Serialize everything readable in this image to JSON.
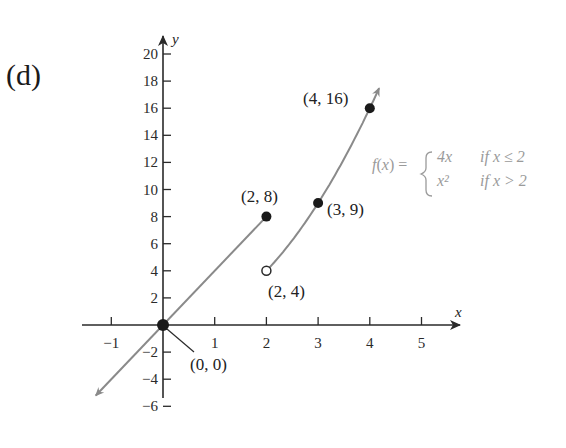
{
  "panel_label": "(d)",
  "chart_data": {
    "type": "line",
    "title": "",
    "xlabel": "x",
    "ylabel": "y",
    "xlim": [
      -1.5,
      5.7
    ],
    "ylim": [
      -7,
      21
    ],
    "grid": false,
    "x_ticks": [
      -1,
      1,
      2,
      3,
      4,
      5
    ],
    "x_tick_labels": [
      "-1",
      "1",
      "2",
      "3",
      "4",
      "5"
    ],
    "y_ticks": [
      -6,
      -4,
      -2,
      2,
      4,
      6,
      8,
      10,
      12,
      14,
      16,
      18,
      20
    ],
    "y_tick_labels": [
      "-6",
      "-4",
      "-2",
      "2",
      "4",
      "6",
      "8",
      "10",
      "12",
      "14",
      "16",
      "18",
      "20"
    ],
    "function_label": "f(x) =",
    "piecewise": [
      {
        "expr": "4x",
        "condition": "if x ≤ 2"
      },
      {
        "expr": "x²",
        "condition": "if x > 2"
      }
    ],
    "series": [
      {
        "name": "4x (x ≤ 2)",
        "x": [
          -1.3,
          0,
          2
        ],
        "y": [
          -5.2,
          0,
          8
        ],
        "arrow_start": true
      },
      {
        "name": "x² (x > 2)",
        "x": [
          2,
          2.5,
          3,
          3.5,
          4,
          4.15
        ],
        "y": [
          4,
          6.25,
          9,
          12.25,
          16,
          17.2
        ],
        "arrow_end": true
      }
    ],
    "points": [
      {
        "x": 0,
        "y": 0,
        "label": "(0, 0)",
        "filled": true
      },
      {
        "x": 2,
        "y": 8,
        "label": "(2, 8)",
        "filled": true
      },
      {
        "x": 3,
        "y": 9,
        "label": "(3, 9)",
        "filled": true
      },
      {
        "x": 4,
        "y": 16,
        "label": "(4, 16)",
        "filled": true
      },
      {
        "x": 2,
        "y": 4,
        "label": "(2, 4)",
        "filled": false
      }
    ],
    "colors": {
      "curve": "#8a8a8a",
      "axis": "#2a2a2a",
      "point": "#1a1a1a",
      "formula": "#9a9a9a"
    }
  }
}
